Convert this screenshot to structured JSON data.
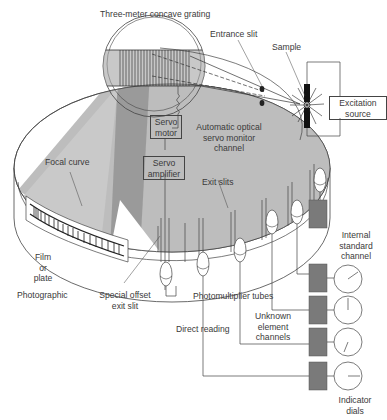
{
  "diagram": {
    "title": "Three-meter concave grating",
    "labels": {
      "grating": "Three-meter concave grating",
      "entrance_slit": "Entrance slit",
      "sample": "Sample",
      "excitation_source_1": "Excitation",
      "excitation_source_2": "source",
      "servo_motor_1": "Servo",
      "servo_motor_2": "motor",
      "servo_amplifier_1": "Servo",
      "servo_amplifier_2": "amplifier",
      "servo_monitor_1": "Automatic optical",
      "servo_monitor_2": "servo monitor",
      "servo_monitor_3": "channel",
      "focal_curve": "Focal curve",
      "exit_slits": "Exit slits",
      "film_1": "Film",
      "film_2": "or",
      "film_3": "plate",
      "photographic": "Photographic",
      "special_offset_1": "Special offset",
      "special_offset_2": "exit slit",
      "photomultiplier_tubes": "Photomultiplier tubes",
      "internal_standard_1": "Internal",
      "internal_standard_2": "standard",
      "internal_standard_3": "channel",
      "unknown_1": "Unknown",
      "unknown_2": "element",
      "unknown_3": "channels",
      "direct_reading": "Direct reading",
      "indicator_1": "Indicator",
      "indicator_2": "dials"
    },
    "colors": {
      "line": "#444444",
      "shade_light": "#bdbdbd",
      "shade_dark": "#8f8f8f",
      "box_fill": "#7a7a7a"
    }
  }
}
